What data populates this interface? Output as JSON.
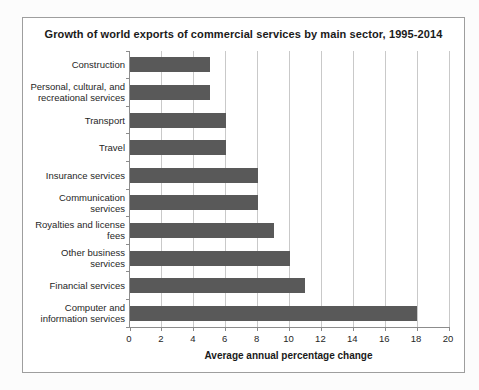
{
  "chart_data": {
    "type": "bar",
    "orientation": "horizontal",
    "title": "Growth of world exports of commercial services by main sector, 1995-2014",
    "xlabel": "Average annual percentage change",
    "ylabel": "",
    "categories": [
      "Construction",
      "Personal, cultural, and recreational services",
      "Transport",
      "Travel",
      "Insurance services",
      "Communication services",
      "Royalties and license fees",
      "Other business services",
      "Financial services",
      "Computer and information services"
    ],
    "values": [
      5,
      5,
      6,
      6,
      8,
      8,
      9,
      10,
      11,
      18
    ],
    "xlim": [
      0,
      20
    ],
    "xticks": [
      0,
      2,
      4,
      6,
      8,
      10,
      12,
      14,
      16,
      18,
      20
    ],
    "grid": "vertical gridlines on, horizontal off",
    "legend": "none",
    "colors": {
      "bar": "#595959",
      "gridline": "#c9c9c9",
      "axis": "#8c8c8c",
      "frame_border": "#9e9e9e",
      "text": "#262626",
      "background": "#ffffff"
    }
  }
}
